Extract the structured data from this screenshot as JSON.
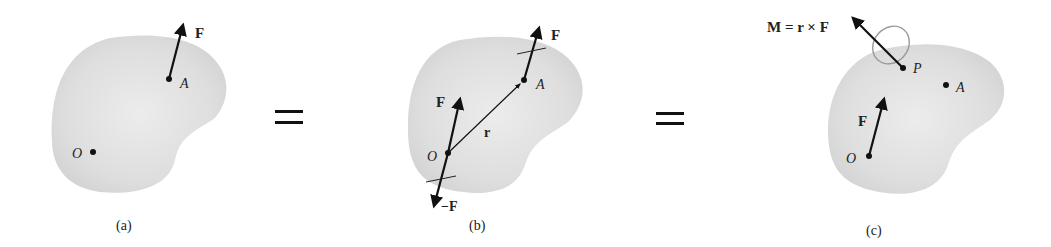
{
  "figure": {
    "panels": [
      {
        "id": "a",
        "caption": "(a)",
        "labels": {
          "force": "F",
          "point_A": "A",
          "origin": "O"
        }
      },
      {
        "id": "b",
        "caption": "(b)",
        "labels": {
          "force_at_A": "F",
          "point_A": "A",
          "force_at_O": "F",
          "neg_force_at_O": "−F",
          "position_vector": "r",
          "origin": "O"
        }
      },
      {
        "id": "c",
        "caption": "(c)",
        "labels": {
          "moment": "M = r × F",
          "point_P": "P",
          "point_A": "A",
          "force": "F",
          "origin": "O"
        }
      }
    ],
    "equals_1": "=",
    "equals_2": "=",
    "colors": {
      "body": "#d9d9d9",
      "body_edge": "#cfcfcf",
      "ink": "#111111",
      "ring": "#9a9a9a"
    }
  }
}
